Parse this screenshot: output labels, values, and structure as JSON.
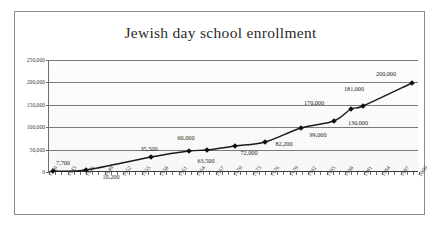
{
  "chart_data": {
    "type": "line",
    "title": "Jewish day school enrollment",
    "xlabel": "",
    "ylabel": "",
    "xlim": [
      1940,
      2000
    ],
    "ylim": [
      0,
      250000
    ],
    "grid": true,
    "legend": "none",
    "x_tick_labels": [
      "1940",
      "1943",
      "1946",
      "1949",
      "1952",
      "1955",
      "1958",
      "1961",
      "1964",
      "1967",
      "1970",
      "1973",
      "1976",
      "1979",
      "1982",
      "1985",
      "1988",
      "1991",
      "1994",
      "1997",
      "2000"
    ],
    "y_tick_labels": [
      "250,000",
      "200,000",
      "150,000",
      "100,000",
      "50,000",
      "0"
    ],
    "y_tick_values": [
      250000,
      200000,
      150000,
      100000,
      50000,
      0
    ],
    "series": [
      {
        "name": "Enrollment",
        "marker": "diamond",
        "points": [
          {
            "x": 1941,
            "y": 7700,
            "label": "7,700"
          },
          {
            "x": 1946,
            "y": 10200,
            "label": "10,200"
          },
          {
            "x": 1956,
            "y": 35500,
            "label": "35,500"
          },
          {
            "x": 1963,
            "y": 60000,
            "label": "60,000"
          },
          {
            "x": 1966,
            "y": 63500,
            "label": "63,500"
          },
          {
            "x": 1971,
            "y": 72000,
            "label": "72,000"
          },
          {
            "x": 1976,
            "y": 82200,
            "label": "82,200"
          },
          {
            "x": 1982,
            "y": 99000,
            "label": "99,000"
          },
          {
            "x": 1987,
            "y": 130000,
            "label": "130,000"
          },
          {
            "x": 1990,
            "y": 170000,
            "label": "170,000"
          },
          {
            "x": 1992,
            "y": 181000,
            "label": "181,000"
          },
          {
            "x": 2000,
            "y": 200000,
            "label": "200,000"
          }
        ]
      }
    ],
    "data_label_positions": [
      {
        "label": "7,700",
        "px": 62,
        "py": 162
      },
      {
        "label": "10,200",
        "px": 110,
        "py": 176
      },
      {
        "label": "35,500",
        "px": 148,
        "py": 148
      },
      {
        "label": "60,000",
        "px": 185,
        "py": 137
      },
      {
        "label": "63,500",
        "px": 205,
        "py": 160
      },
      {
        "label": "72,000",
        "px": 248,
        "py": 152
      },
      {
        "label": "82,200",
        "px": 283,
        "py": 143
      },
      {
        "label": "99,000",
        "px": 317,
        "py": 134
      },
      {
        "label": "130,000",
        "px": 357,
        "py": 122
      },
      {
        "label": "170,000",
        "px": 313,
        "py": 102
      },
      {
        "label": "181,000",
        "px": 353,
        "py": 88
      },
      {
        "label": "200,000",
        "px": 385,
        "py": 73
      }
    ],
    "marker_positions": [
      {
        "px": 52,
        "py": 171
      },
      {
        "px": 85,
        "py": 170
      },
      {
        "px": 150,
        "py": 157
      },
      {
        "px": 188,
        "py": 151
      },
      {
        "px": 206,
        "py": 150
      },
      {
        "px": 234,
        "py": 146
      },
      {
        "px": 264,
        "py": 142
      },
      {
        "px": 300,
        "py": 128
      },
      {
        "px": 333,
        "py": 121
      },
      {
        "px": 350,
        "py": 109
      },
      {
        "px": 362,
        "py": 106
      },
      {
        "px": 411,
        "py": 83
      }
    ]
  }
}
